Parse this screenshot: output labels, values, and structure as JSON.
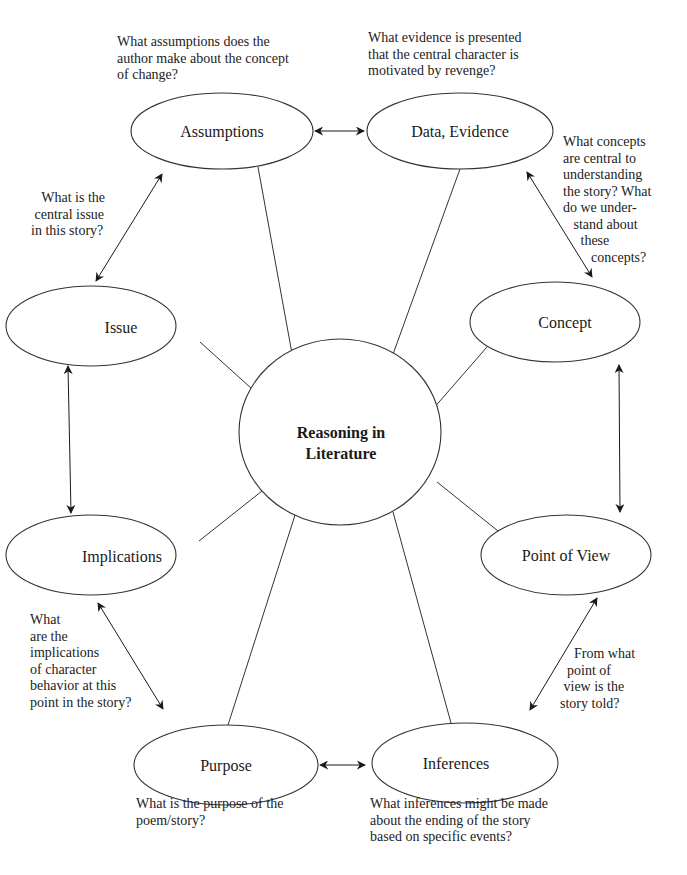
{
  "diagram": {
    "title": "Reasoning in Literature",
    "center": {
      "line1": "Reasoning in",
      "line2": "Literature"
    },
    "nodes": [
      {
        "id": "assumptions",
        "label": "Assumptions"
      },
      {
        "id": "data-evidence",
        "label": "Data, Evidence"
      },
      {
        "id": "concept",
        "label": "Concept"
      },
      {
        "id": "point-of-view",
        "label": "Point of View"
      },
      {
        "id": "inferences",
        "label": "Inferences"
      },
      {
        "id": "purpose",
        "label": "Purpose"
      },
      {
        "id": "implications",
        "label": "Implications"
      },
      {
        "id": "issue",
        "label": "Issue"
      }
    ],
    "questions": {
      "assumptions": "What assumptions does the\nauthor make about the concept\nof change?",
      "data_evidence": "What evidence is presented\nthat the central character is\nmotivated by revenge?",
      "concept": "What concepts\nare central to\nunderstanding\nthe story? What\ndo we under-\n   stand about\n     these\n        concepts?",
      "issue": "   What is the\n central issue\nin this story?",
      "implications": "What\nare the\nimplications\nof character\nbehavior at this\npoint in the story?",
      "point_of_view": "    From what\n  point of\n view is the\nstory told?",
      "purpose": "What is the purpose of the\npoem/story?",
      "inferences": "What inferences might be made\nabout the ending of the story\nbased on specific events?"
    },
    "connections": [
      "Assumptions <-> Data, Evidence",
      "Data, Evidence <-> Concept",
      "Concept <-> Point of View",
      "Point of View <-> Inferences",
      "Inferences <-> Purpose",
      "Purpose <-> Implications",
      "Implications <-> Issue",
      "Issue <-> Assumptions"
    ],
    "colors": {
      "stroke": "#333333",
      "text": "#1a1a1a",
      "background": "#ffffff"
    }
  }
}
